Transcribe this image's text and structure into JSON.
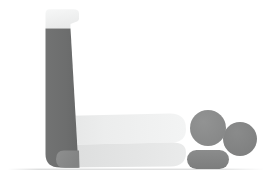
{
  "canvas": {
    "width": 273,
    "height": 179,
    "background": "#ffffff",
    "title": "Abstract grayscale object illustration"
  },
  "palette": {
    "background": "#ffffff",
    "dark_gray": "#6f7070",
    "dark_gray_shade": "#656666",
    "mid_gray": "#8a8b8b",
    "mid_gray_shade": "#818282",
    "light_gray": "#e2e3e3",
    "lighter_gray": "#eceded",
    "near_white": "#f4f5f5",
    "ground_line": "#d9dada"
  },
  "shapes": [
    {
      "id": "vertical-column",
      "name": "vertical-column",
      "role": "upright dark bar",
      "color": "#6f7070",
      "bbox": [
        44,
        27,
        27,
        140
      ]
    },
    {
      "id": "column-top-flare",
      "name": "column-top-flare",
      "role": "light flared cap at top of column",
      "color": "#f4f5f5",
      "bbox": [
        44,
        9,
        35,
        20
      ]
    },
    {
      "id": "horizontal-arm-upper",
      "name": "horizontal-arm-upper",
      "role": "light tapered arm extending right",
      "color": "#eceded",
      "bbox": [
        60,
        113,
        126,
        30
      ]
    },
    {
      "id": "horizontal-arm-lower",
      "name": "horizontal-arm-lower",
      "role": "shaded underside band of arm",
      "color": "#e2e3e3",
      "bbox": [
        60,
        137,
        126,
        30
      ]
    },
    {
      "id": "base-foot",
      "name": "base-foot",
      "role": "rounded mid-gray foot at column base",
      "color": "#8a8b8b",
      "bbox": [
        56,
        150,
        34,
        18
      ]
    },
    {
      "id": "circle-left",
      "name": "circle-left",
      "role": "left medium-gray disc",
      "color": "#8a8b8b",
      "cx": 208,
      "cy": 128,
      "r": 18
    },
    {
      "id": "circle-right",
      "name": "circle-right",
      "role": "right medium-gray disc",
      "color": "#818282",
      "cx": 240,
      "cy": 139,
      "r": 17
    },
    {
      "id": "capsule",
      "name": "capsule",
      "role": "horizontal rounded pill",
      "color": "#818282",
      "bbox": [
        187,
        150,
        42,
        19
      ]
    },
    {
      "id": "ground-line",
      "name": "ground-line",
      "role": "faint horizontal ground line",
      "color": "#d9dada",
      "y": 169,
      "x_start": 12,
      "x_end": 262
    }
  ],
  "labels": {
    "alt_text": "Minimal grayscale illustration of an L-shaped form with three rounded objects beside it"
  }
}
